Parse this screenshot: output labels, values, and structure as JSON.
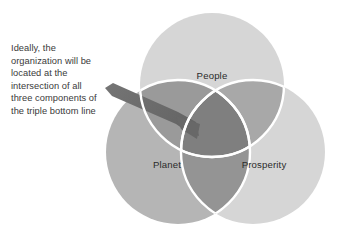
{
  "diagram": {
    "type": "venn-3",
    "title": "Triple Bottom Line",
    "background_color": "#ffffff",
    "circles": [
      {
        "id": "people",
        "label": "People",
        "position": "top-center",
        "fill": "#d6d6d6",
        "cx": 212,
        "cy": 85,
        "r": 72,
        "label_x": 212,
        "label_y": 79
      },
      {
        "id": "planet",
        "label": "Planet",
        "position": "bottom-left",
        "fill": "#b5b5b5",
        "cx": 178,
        "cy": 152,
        "r": 72,
        "label_x": 167,
        "label_y": 168
      },
      {
        "id": "prosperity",
        "label": "Prosperity",
        "position": "bottom-right",
        "fill": "#d6d6d6",
        "cx": 253,
        "cy": 152,
        "r": 72,
        "label_x": 264,
        "label_y": 168
      }
    ],
    "overlaps": {
      "pair_fill": "#949494",
      "pair_fill_dark": "#8a8a8a",
      "triple_fill": "#7c7c7c",
      "divider_color": "#ffffff",
      "divider_width": 2.2
    },
    "arrow": {
      "id": "intersection-arrow",
      "color": "#6e6e6e",
      "description": "tapered arrow pointing to the central triple intersection",
      "tail_x": 105,
      "tail_y": 88,
      "tip_x": 193,
      "tip_y": 133
    }
  },
  "caption": {
    "id": "intersection-note",
    "text": "Ideally, the organization will be located at the intersection of all three components of the triple bottom line",
    "color": "#3a3a3a",
    "lines": [
      "Ideally, the",
      "organization will be",
      "located at the",
      "intersection of all",
      "three components of",
      "the triple bottom line"
    ]
  }
}
